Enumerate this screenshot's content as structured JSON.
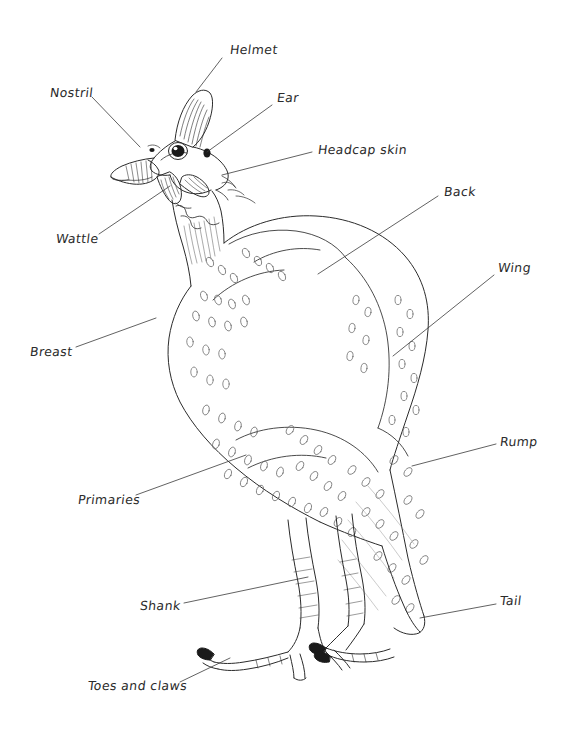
{
  "diagram": {
    "style": "hand-drawn pen-and-ink line drawing with handwritten labels and leader lines",
    "background_color": "#ffffff",
    "ink_color": "#2b2b2b",
    "labels": [
      {
        "id": "helmet",
        "text": "Helmet",
        "x": 230,
        "y": 50,
        "leader": [
          [
            222,
            58
          ],
          [
            196,
            92
          ]
        ]
      },
      {
        "id": "nostril",
        "text": "Nostril",
        "x": 50,
        "y": 93,
        "leader": [
          [
            92,
            97
          ],
          [
            140,
            147
          ]
        ]
      },
      {
        "id": "ear",
        "text": "Ear",
        "x": 277,
        "y": 98,
        "leader": [
          [
            272,
            105
          ],
          [
            207,
            152
          ]
        ]
      },
      {
        "id": "headcap-skin",
        "text": "Headcap skin",
        "x": 318,
        "y": 150,
        "leader": [
          [
            312,
            152
          ],
          [
            222,
            175
          ]
        ]
      },
      {
        "id": "wattle",
        "text": "Wattle",
        "x": 56,
        "y": 239,
        "leader": [
          [
            99,
            234
          ],
          [
            170,
            186
          ]
        ]
      },
      {
        "id": "back",
        "text": "Back",
        "x": 444,
        "y": 192,
        "leader": [
          [
            438,
            196
          ],
          [
            318,
            274
          ]
        ]
      },
      {
        "id": "breast",
        "text": "Breast",
        "x": 30,
        "y": 352,
        "leader": [
          [
            76,
            347
          ],
          [
            156,
            318
          ]
        ]
      },
      {
        "id": "wing",
        "text": "Wing",
        "x": 498,
        "y": 268,
        "leader": [
          [
            494,
            275
          ],
          [
            393,
            356
          ]
        ]
      },
      {
        "id": "rump",
        "text": "Rump",
        "x": 500,
        "y": 442,
        "leader": [
          [
            496,
            444
          ],
          [
            412,
            466
          ]
        ]
      },
      {
        "id": "primaries",
        "text": "Primaries",
        "x": 78,
        "y": 500,
        "leader": [
          [
            136,
            495
          ],
          [
            246,
            455
          ]
        ]
      },
      {
        "id": "shank",
        "text": "Shank",
        "x": 140,
        "y": 606,
        "leader": [
          [
            184,
            603
          ],
          [
            308,
            577
          ]
        ]
      },
      {
        "id": "tail",
        "text": "Tail",
        "x": 500,
        "y": 601,
        "leader": [
          [
            496,
            604
          ],
          [
            420,
            618
          ]
        ]
      },
      {
        "id": "toes-and-claws",
        "text": "Toes and claws",
        "x": 88,
        "y": 686,
        "leader": [
          [
            180,
            682
          ],
          [
            230,
            658
          ]
        ]
      }
    ]
  }
}
